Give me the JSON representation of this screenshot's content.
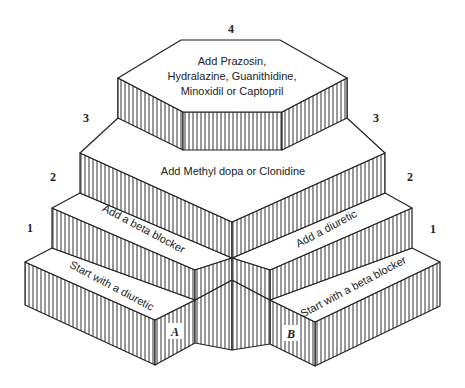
{
  "diagram": {
    "type": "stepped-pyramid",
    "colors": {
      "line": "#222222",
      "hatch": "#333333",
      "background": "#ffffff",
      "label_bg": "#ffffff"
    },
    "levels": [
      {
        "number": "1",
        "label_left": "1",
        "label_right": "1"
      },
      {
        "number": "2",
        "label_left": "2",
        "label_right": "2"
      },
      {
        "number": "3",
        "label_left": "3",
        "label_right": "3"
      },
      {
        "number": "4",
        "label_top": "4"
      }
    ],
    "path_a": {
      "marker": "A",
      "step1": "Start with a diuretic",
      "step2": "Add a beta blocker"
    },
    "path_b": {
      "marker": "B",
      "step1": "Start with a beta blocker",
      "step2": "Add a diuretic"
    },
    "step3": "Add Methyl dopa or Clonidine",
    "step4": {
      "line1": "Add Prazosin,",
      "line2": "Hydralazine, Guanithidine,",
      "line3": "Minoxidil or Captopril"
    }
  }
}
